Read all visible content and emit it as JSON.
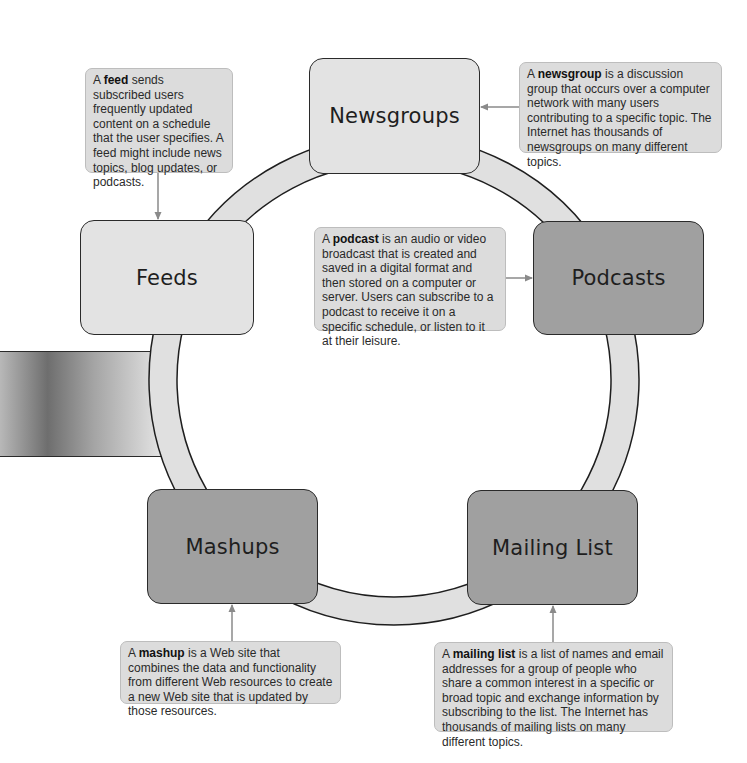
{
  "diagram": {
    "nodes": [
      {
        "id": "newsgroups",
        "label": "Newsgroups",
        "shade": "light"
      },
      {
        "id": "podcasts",
        "label": "Podcasts",
        "shade": "dark"
      },
      {
        "id": "mailing_list",
        "label": "Mailing List",
        "shade": "dark"
      },
      {
        "id": "mashups",
        "label": "Mashups",
        "shade": "dark"
      },
      {
        "id": "feeds",
        "label": "Feeds",
        "shade": "light"
      }
    ],
    "callouts": {
      "feed": {
        "prefix": "A ",
        "term": "feed",
        "text": " sends subscribed users frequently updated content on a schedule that the user specifies. A feed might include news topics, blog updates, or podcasts."
      },
      "newsgroup": {
        "prefix": "A ",
        "term": "newsgroup",
        "text": " is a discussion group that occurs over a computer network with many users contributing to a specific topic. The Internet has thousands of newsgroups on many different topics."
      },
      "podcast": {
        "prefix": "A ",
        "term": "podcast",
        "text": " is an audio or video broadcast that is created and saved in a digital format and then stored on a computer or server. Users can subscribe to a podcast to receive it on a specific schedule, or listen to it at their leisure."
      },
      "mashup": {
        "prefix": "A ",
        "term": "mashup",
        "text": " is a Web site that combines the data and functionality from different Web resources to create a new Web site that is updated by those resources."
      },
      "mailing_list": {
        "prefix": "A ",
        "term": "mailing list",
        "text": " is a list of names and email addresses for a group of people who share a common interest in a specific or broad topic and exchange information by subscribing to the list. The Internet has thousands of mailing lists on many different topics."
      }
    },
    "colors": {
      "ring": "#e0e0e0",
      "node_light": "#e3e3e3",
      "node_dark": "#a0a0a0",
      "callout": "#dcdcdc",
      "arrow": "#8a8a8a"
    }
  }
}
